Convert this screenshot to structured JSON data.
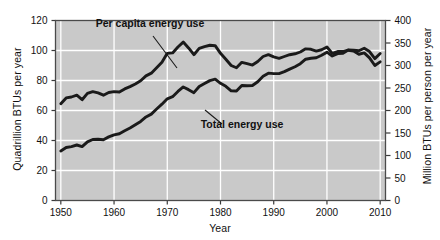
{
  "chart_data": {
    "type": "line",
    "title": "",
    "xlabel": "Year",
    "ylabel": "Quadrillion BTUs per year",
    "ylabel_right": "Million BTUs per person per year",
    "xlim": [
      1949,
      2011
    ],
    "ylim": [
      0,
      120
    ],
    "ylim_right": [
      0,
      400
    ],
    "xticks": [
      "1950",
      "1960",
      "1970",
      "1980",
      "1990",
      "2000",
      "2010"
    ],
    "xtick_values": [
      1950,
      1960,
      1970,
      1980,
      1990,
      2000,
      2010
    ],
    "yticks_left": [
      "0",
      "20",
      "40",
      "60",
      "80",
      "100",
      "120"
    ],
    "ytick_values_left": [
      0,
      20,
      40,
      60,
      80,
      100,
      120
    ],
    "yticks_right": [
      "0",
      "50",
      "100",
      "150",
      "200",
      "250",
      "300",
      "350",
      "400"
    ],
    "ytick_values_right": [
      0,
      50,
      100,
      150,
      200,
      250,
      300,
      350,
      400
    ],
    "grid": true,
    "grid_color": "#ffffff",
    "plot_background": "#c9c9c9",
    "line_color": "#1a1a1a",
    "legend_position": "inline-annotations",
    "series": [
      {
        "name": "Per capita energy use",
        "axis": "right",
        "units": "Million BTUs per person per year",
        "x": [
          1950,
          1951,
          1952,
          1953,
          1954,
          1955,
          1956,
          1957,
          1958,
          1959,
          1960,
          1961,
          1962,
          1963,
          1964,
          1965,
          1966,
          1967,
          1968,
          1969,
          1970,
          1971,
          1972,
          1973,
          1974,
          1975,
          1976,
          1977,
          1978,
          1979,
          1980,
          1981,
          1982,
          1983,
          1984,
          1985,
          1986,
          1987,
          1988,
          1989,
          1990,
          1991,
          1992,
          1993,
          1994,
          1995,
          1996,
          1997,
          1998,
          1999,
          2000,
          2001,
          2002,
          2003,
          2004,
          2005,
          2006,
          2007,
          2008,
          2009,
          2010
        ],
        "values": [
          215,
          228,
          230,
          234,
          224,
          238,
          242,
          239,
          234,
          240,
          242,
          241,
          248,
          253,
          259,
          266,
          277,
          283,
          295,
          307,
          327,
          328,
          341,
          352,
          339,
          324,
          338,
          342,
          345,
          344,
          327,
          314,
          300,
          295,
          307,
          304,
          301,
          309,
          320,
          324,
          319,
          316,
          320,
          324,
          326,
          330,
          337,
          336,
          332,
          335,
          341,
          327,
          331,
          331,
          334,
          332,
          325,
          328,
          317,
          300,
          308
        ]
      },
      {
        "name": "Total energy use",
        "axis": "left",
        "units": "Quadrillion BTUs per year",
        "x": [
          1950,
          1951,
          1952,
          1953,
          1954,
          1955,
          1956,
          1957,
          1958,
          1959,
          1960,
          1961,
          1962,
          1963,
          1964,
          1965,
          1966,
          1967,
          1968,
          1969,
          1970,
          1971,
          1972,
          1973,
          1974,
          1975,
          1976,
          1977,
          1978,
          1979,
          1980,
          1981,
          1982,
          1983,
          1984,
          1985,
          1986,
          1987,
          1988,
          1989,
          1990,
          1991,
          1992,
          1993,
          1994,
          1995,
          1996,
          1997,
          1998,
          1999,
          2000,
          2001,
          2002,
          2003,
          2004,
          2005,
          2006,
          2007,
          2008,
          2009,
          2010
        ],
        "values": [
          33.0,
          35.3,
          35.9,
          37.0,
          35.9,
          39.1,
          40.7,
          40.8,
          40.5,
          42.4,
          43.8,
          44.5,
          46.5,
          48.3,
          50.5,
          52.7,
          55.7,
          57.6,
          61.0,
          64.2,
          67.8,
          69.2,
          72.7,
          75.7,
          73.9,
          71.9,
          76.0,
          78.0,
          79.9,
          80.9,
          78.1,
          76.1,
          73.1,
          73.0,
          76.7,
          76.5,
          76.7,
          79.2,
          82.8,
          84.9,
          84.6,
          84.6,
          85.9,
          87.6,
          89.2,
          91.2,
          94.2,
          94.8,
          95.2,
          96.8,
          98.9,
          96.3,
          97.9,
          98.2,
          100.4,
          100.2,
          99.8,
          101.5,
          99.3,
          94.6,
          98.0
        ]
      }
    ],
    "annotations": [
      {
        "text": "Per capita energy use",
        "label_x": 150,
        "label_y": 27,
        "leader_from": [
          153,
          36
        ],
        "leader_to": [
          177,
          68
        ]
      },
      {
        "text": "Total energy use",
        "label_x": 242,
        "label_y": 128,
        "leader_from": [
          222,
          124
        ],
        "leader_to": [
          205,
          110
        ]
      }
    ]
  }
}
